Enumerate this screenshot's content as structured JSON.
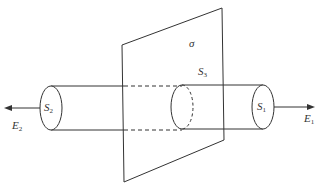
{
  "diagram": {
    "plane_label": "σ",
    "surfaces": [
      {
        "id": "S1",
        "base": "S",
        "sub": "1"
      },
      {
        "id": "S2",
        "base": "S",
        "sub": "2"
      },
      {
        "id": "S3",
        "base": "S",
        "sub": "3"
      }
    ],
    "fields": [
      {
        "id": "E1",
        "base": "E",
        "sub": "1",
        "direction": "right"
      },
      {
        "id": "E2",
        "base": "E",
        "sub": "2",
        "direction": "left"
      }
    ],
    "colors": {
      "stroke": "#333333",
      "background": "#ffffff"
    }
  }
}
